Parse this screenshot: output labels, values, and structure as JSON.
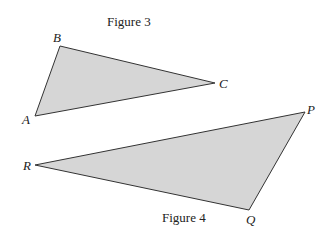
{
  "figures": [
    {
      "caption": "Figure 3",
      "vertices": [
        {
          "label": "A",
          "x": 35,
          "y": 116
        },
        {
          "label": "B",
          "x": 60,
          "y": 46
        },
        {
          "label": "C",
          "x": 215,
          "y": 83
        }
      ]
    },
    {
      "caption": "Figure 4",
      "vertices": [
        {
          "label": "P",
          "x": 305,
          "y": 112
        },
        {
          "label": "Q",
          "x": 249,
          "y": 210
        },
        {
          "label": "R",
          "x": 35,
          "y": 165
        }
      ]
    }
  ],
  "colors": {
    "fill": "#d6d6d6",
    "stroke": "#333333"
  }
}
